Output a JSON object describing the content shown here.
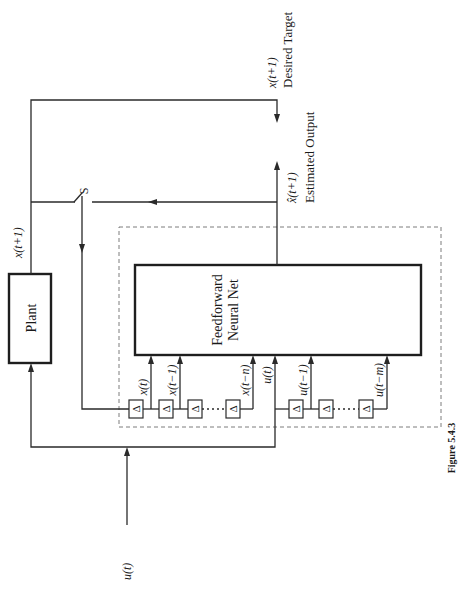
{
  "figure": {
    "caption": "Figure 5.4.3"
  },
  "blocks": {
    "plant": "Plant",
    "nn_line1": "Feedforward",
    "nn_line2": "Neural Net",
    "delay_symbol": "Δ"
  },
  "signals": {
    "input": "u(t)",
    "plant_output": "x(t+1)",
    "switch": "S",
    "desired_value": "x(t+1)",
    "desired_label": "Desired Target",
    "estimated_value": "x̂(t+1)",
    "estimated_label": "Estimated Output"
  },
  "taps": {
    "x": [
      "x(t)",
      "x(t−1)",
      "x(t−n)"
    ],
    "u": [
      "u(t)",
      "u(t−1)",
      "u(t−m)"
    ]
  }
}
